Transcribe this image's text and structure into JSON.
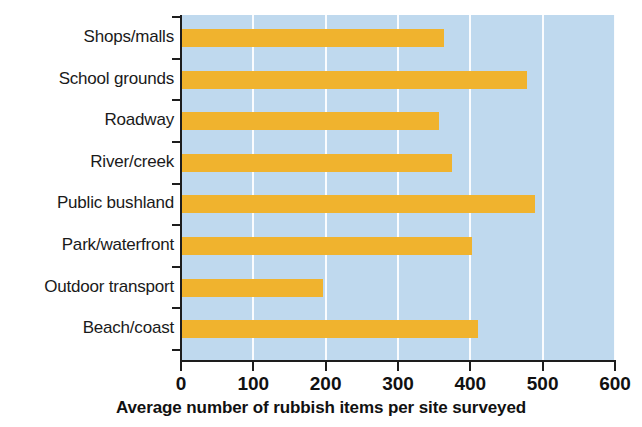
{
  "chart_data": {
    "type": "bar",
    "orientation": "horizontal",
    "title": "",
    "xlabel": "Average number of rubbish items per site surveyed",
    "ylabel": "",
    "categories": [
      "Shops/malls",
      "School grounds",
      "Roadway",
      "River/creek",
      "Public bushland",
      "Park/waterfront",
      "Outdoor transport",
      "Beach/coast"
    ],
    "values": [
      363,
      478,
      356,
      374,
      490,
      402,
      197,
      410
    ],
    "xlim": [
      0,
      600
    ],
    "xticks": [
      0,
      100,
      200,
      300,
      400,
      500,
      600
    ],
    "xtick_labels": [
      "0",
      "100",
      "200",
      "300",
      "400",
      "500",
      "600"
    ],
    "grid": "vertical",
    "legend": "none",
    "colors": {
      "bar": "#f0b32e",
      "plot_background": "#bfd9ee",
      "gridline": "#ffffff",
      "axis": "#1d1d1d",
      "text": "#111111",
      "page_background": "#ffffff"
    }
  }
}
